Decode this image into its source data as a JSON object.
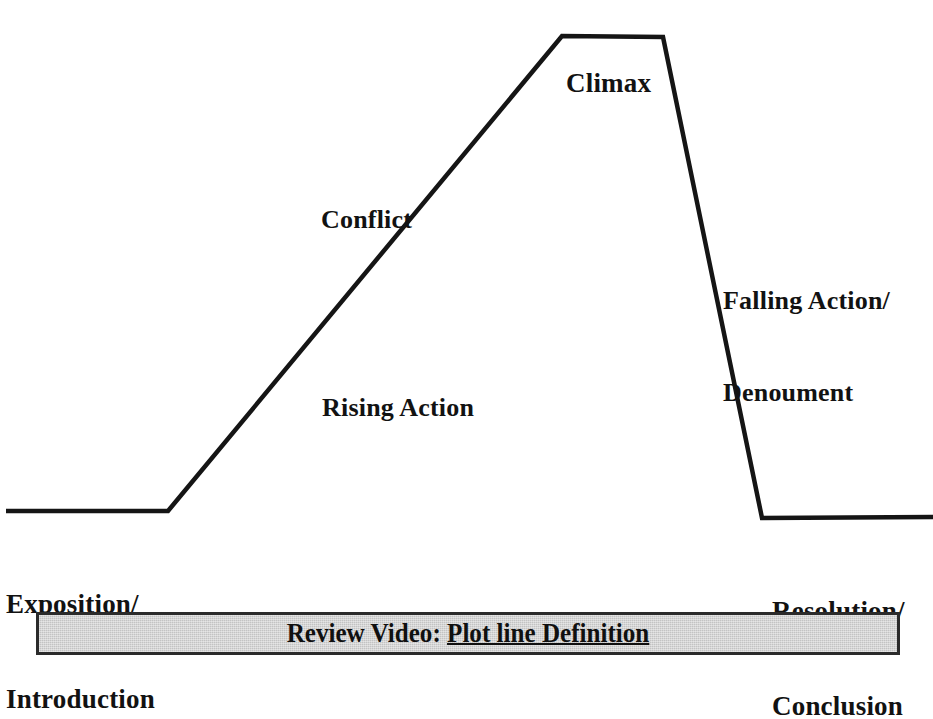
{
  "chart_data": {
    "type": "line",
    "title": "",
    "xlabel": "",
    "ylabel": "",
    "grid": false,
    "legend": "none",
    "xlim": [
      0,
      933
    ],
    "ylim": [
      0,
      600
    ],
    "annotations": [
      "Climax",
      "Conflict",
      "Rising Action",
      "Falling Action/",
      "Denoument",
      "Exposition/",
      "Introduction",
      "Resolution/",
      "Conclusion"
    ],
    "series": [
      {
        "name": "plot-line",
        "points": [
          {
            "x": 6,
            "y": 511,
            "stage": "Exposition/Introduction"
          },
          {
            "x": 168,
            "y": 511,
            "stage": "Exposition/Introduction"
          },
          {
            "x": 562,
            "y": 36,
            "stage": "Rising Action / Conflict"
          },
          {
            "x": 663,
            "y": 37,
            "stage": "Climax"
          },
          {
            "x": 762,
            "y": 518,
            "stage": "Falling Action/Denoument"
          },
          {
            "x": 933,
            "y": 517,
            "stage": "Resolution/Conclusion"
          }
        ]
      }
    ]
  },
  "diagram": {
    "labels": {
      "climax": "Climax",
      "conflict": "Conflict",
      "rising_action": "Rising Action",
      "falling_action_line1": "Falling Action/",
      "falling_action_line2": "Denoument",
      "exposition_line1": "Exposition/",
      "exposition_line2": "Introduction",
      "resolution_line1": "Resolution/",
      "resolution_line2": "Conclusion"
    },
    "line_color": "#151515",
    "line_width": 4,
    "background_color": "#ffffff"
  },
  "banner": {
    "prefix": "Review Video: ",
    "link_text": "Plot line Definition",
    "background_color": "#c3c3c3",
    "border_color": "#2b2b2b",
    "text_color": "#101010"
  }
}
